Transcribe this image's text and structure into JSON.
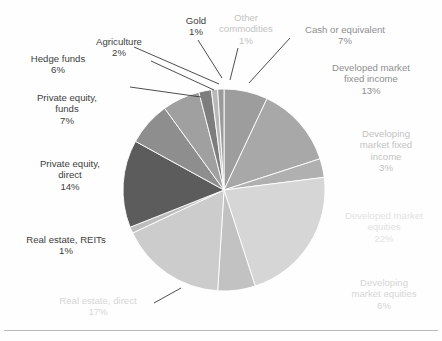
{
  "figure": {
    "background": "#fefefe",
    "rule_color": "#b9b9b9"
  },
  "chart_data": {
    "type": "pie",
    "title": "",
    "subtitle": "",
    "xlabel": "",
    "ylabel": "",
    "legend_position": "none",
    "grid": false,
    "start_angle_deg": 0,
    "direction": "clockwise",
    "total_percent": 100,
    "labels": [
      "Cash or equivalent",
      "Developed market fixed income",
      "Developing market fixed income",
      "Developed market equities",
      "Developing market equities",
      "Real estate, direct",
      "Real estate, REITs",
      "Private equity, direct",
      "Private equity, funds",
      "Hedge funds",
      "Agriculture",
      "Gold",
      "Other commodities"
    ],
    "values": [
      7,
      13,
      3,
      22,
      6,
      17,
      1,
      14,
      7,
      6,
      2,
      1,
      1
    ],
    "value_labels": [
      "7%",
      "13%",
      "3%",
      "22%",
      "6%",
      "17%",
      "1%",
      "14%",
      "7%",
      "6%",
      "2%",
      "1%",
      "1%"
    ],
    "colors": [
      "#9d9d9d",
      "#a8a8a8",
      "#b0b0b0",
      "#d6d6d6",
      "#c2c2c2",
      "#cccccc",
      "#bdbdbd",
      "#5c5c5c",
      "#8e8e8e",
      "#a0a0a0",
      "#7d7d7d",
      "#b8b8b8",
      "#9a9a9a"
    ],
    "slice_separator_color": "#ffffff"
  },
  "slices": [
    {
      "name": "cash-or-equivalent",
      "label": "Cash or equivalent",
      "line1": "Cash or equivalent",
      "line2": "",
      "line3": "",
      "pct": "7%",
      "tone": "mid"
    },
    {
      "name": "developed-market-fixed-income",
      "label": "Developed market fixed income",
      "line1": "Developed market",
      "line2": "fixed income",
      "line3": "",
      "pct": "13%",
      "tone": "mid"
    },
    {
      "name": "developing-market-fixed-income",
      "label": "Developing market fixed income",
      "line1": "Developing",
      "line2": "market fixed",
      "line3": "income",
      "pct": "3%",
      "tone": "faint"
    },
    {
      "name": "developed-market-equities",
      "label": "Developed market equities",
      "line1": "Developed market",
      "line2": "equities",
      "line3": "",
      "pct": "22%",
      "tone": "ghost"
    },
    {
      "name": "developing-market-equities",
      "label": "Developing market equities",
      "line1": "Developing",
      "line2": "market equities",
      "line3": "",
      "pct": "6%",
      "tone": "veryfaint"
    },
    {
      "name": "real-estate-direct",
      "label": "Real estate, direct",
      "line1": "Real estate, direct",
      "line2": "",
      "line3": "",
      "pct": "17%",
      "tone": "veryfaint"
    },
    {
      "name": "real-estate-reits",
      "label": "Real estate, REITs",
      "line1": "Real estate, REITs",
      "line2": "",
      "line3": "",
      "pct": "1%",
      "tone": "dark"
    },
    {
      "name": "private-equity-direct",
      "label": "Private equity, direct",
      "line1": "Private equity,",
      "line2": "direct",
      "line3": "",
      "pct": "14%",
      "tone": "dark"
    },
    {
      "name": "private-equity-funds",
      "label": "Private equity, funds",
      "line1": "Private equity,",
      "line2": "funds",
      "line3": "",
      "pct": "7%",
      "tone": "dark"
    },
    {
      "name": "hedge-funds",
      "label": "Hedge funds",
      "line1": "Hedge funds",
      "line2": "",
      "line3": "",
      "pct": "6%",
      "tone": "dark"
    },
    {
      "name": "agriculture",
      "label": "Agriculture",
      "line1": "Agriculture",
      "line2": "",
      "line3": "",
      "pct": "2%",
      "tone": "dark"
    },
    {
      "name": "gold",
      "label": "Gold",
      "line1": "Gold",
      "line2": "",
      "line3": "",
      "pct": "1%",
      "tone": "dark"
    },
    {
      "name": "other-commodities",
      "label": "Other commodities",
      "line1": "Other",
      "line2": "commodities",
      "line3": "",
      "pct": "1%",
      "tone": "faint"
    }
  ]
}
